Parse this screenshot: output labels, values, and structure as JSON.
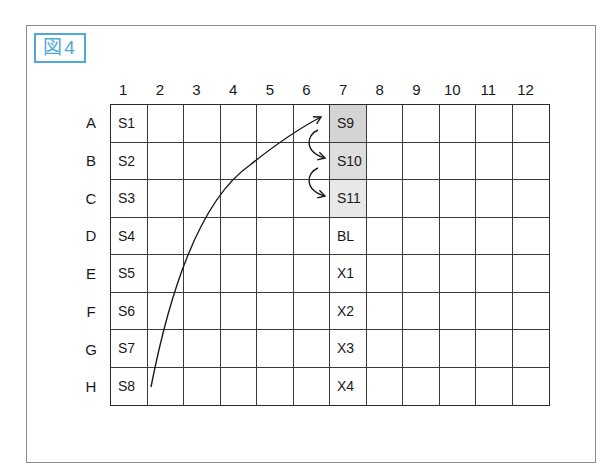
{
  "figure": {
    "label": "図4",
    "label_color": "#4fa8d8"
  },
  "plate": {
    "columns": [
      "1",
      "2",
      "3",
      "4",
      "5",
      "6",
      "7",
      "8",
      "9",
      "10",
      "11",
      "12"
    ],
    "rows": [
      "A",
      "B",
      "C",
      "D",
      "E",
      "F",
      "G",
      "H"
    ],
    "wells": {
      "A1": "S1",
      "B1": "S2",
      "C1": "S3",
      "D1": "S4",
      "E1": "S5",
      "F1": "S6",
      "G1": "S7",
      "H1": "S8",
      "A7": "S9",
      "B7": "S10",
      "C7": "S11",
      "D7": "BL",
      "E7": "X1",
      "F7": "X2",
      "G7": "X3",
      "H7": "X4"
    },
    "shaded_wells": {
      "A7": "#d4d4d4",
      "B7": "#dedede",
      "C7": "#e8e8e8"
    }
  },
  "arrows": [
    {
      "name": "transfer-arrow-h1-to-a7",
      "from": "H1",
      "to": "A7",
      "type": "curved"
    },
    {
      "name": "transfer-arrow-a7-to-b7",
      "from": "A7",
      "to": "B7",
      "type": "curved-small"
    },
    {
      "name": "transfer-arrow-b7-to-c7",
      "from": "B7",
      "to": "C7",
      "type": "curved-small"
    }
  ]
}
